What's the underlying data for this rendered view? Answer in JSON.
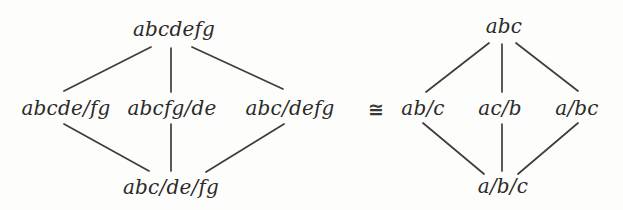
{
  "figure": {
    "relation_symbol": "≅",
    "left_lattice": {
      "top": "abcdefg",
      "middle": [
        "abcde/fg",
        "abcfg/de",
        "abc/defg"
      ],
      "bottom": "abc/de/fg"
    },
    "right_lattice": {
      "top": "abc",
      "middle": [
        "ab/c",
        "ac/b",
        "a/bc"
      ],
      "bottom": "a/b/c"
    },
    "colors": {
      "background": "#fdfdfc",
      "ink": "#2b2a28",
      "edge": "#3f3d3b"
    }
  }
}
